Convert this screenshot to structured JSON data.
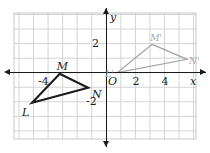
{
  "figure": {
    "type": "coordinate-plane-transformation",
    "axes": {
      "x_label": "x",
      "y_label": "y",
      "origin_label": "O",
      "x_ticks": [
        {
          "value": -4,
          "label": "-4"
        },
        {
          "value": 2,
          "label": "2"
        },
        {
          "value": 4,
          "label": "4"
        }
      ],
      "y_ticks": [
        {
          "value": 2,
          "label": "2"
        },
        {
          "value": -2,
          "label": "-2"
        }
      ],
      "xlim": [
        -6.3,
        6.4
      ],
      "ylim": [
        -4.6,
        4.1
      ],
      "grid": true,
      "grid_step": 1
    },
    "shapes": [
      {
        "name": "triangle-LMN",
        "style": "solid-black",
        "color": "#1b1b1b",
        "vertices": [
          {
            "label": "L",
            "x": -5.1,
            "y": -2.07,
            "label_dx": -10,
            "label_dy": 4
          },
          {
            "label": "M",
            "x": -3.2,
            "y": -0.07,
            "label_dx": -3,
            "label_dy": -13
          },
          {
            "label": "N",
            "x": -1.25,
            "y": -1.03,
            "label_dx": 4,
            "label_dy": 1
          }
        ]
      },
      {
        "name": "triangle-LMN-prime",
        "style": "solid-gray",
        "color": "#a8a8ac",
        "vertices": [
          {
            "label": "L'",
            "x": 0.75,
            "y": 0.0,
            "label_dx": -12,
            "label_dy": -3
          },
          {
            "label": "M'",
            "x": 3.15,
            "y": 1.95,
            "label_dx": -2,
            "label_dy": -10
          },
          {
            "label": "N'",
            "x": 5.55,
            "y": 0.92,
            "label_dx": 2,
            "label_dy": -2
          }
        ]
      }
    ]
  },
  "colors": {
    "grid": "#d3d3d6",
    "axis": "#1b1b1b",
    "preimage": "#1b1b1b",
    "image": "#a8a8ac",
    "background": "#ffffff"
  }
}
